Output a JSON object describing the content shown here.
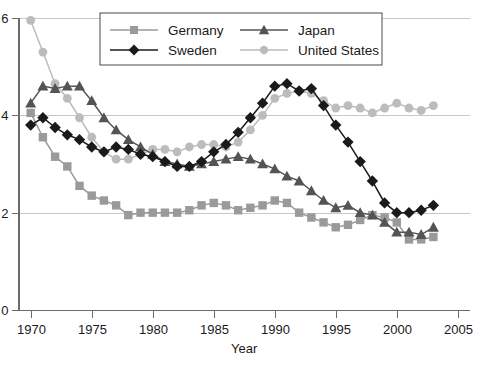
{
  "chart_data": {
    "type": "line",
    "title": "",
    "xlabel": "Year",
    "ylabel": "",
    "xlim": [
      1969,
      2006
    ],
    "ylim": [
      0,
      6
    ],
    "xticks": [
      1970,
      1975,
      1980,
      1985,
      1990,
      1995,
      2000,
      2005
    ],
    "yticks": [
      0,
      2,
      4,
      6
    ],
    "ytick_labels": [
      "0",
      "2",
      "4",
      "6"
    ],
    "xtick_labels": [
      "1970",
      "1975",
      "1980",
      "1985",
      "1990",
      "1995",
      "2000",
      "2005"
    ],
    "grid": "horizontal",
    "legend_position": "top-center",
    "x": [
      1970,
      1971,
      1972,
      1973,
      1974,
      1975,
      1976,
      1977,
      1978,
      1979,
      1980,
      1981,
      1982,
      1983,
      1984,
      1985,
      1986,
      1987,
      1988,
      1989,
      1990,
      1991,
      1992,
      1993,
      1994,
      1995,
      1996,
      1997,
      1998,
      1999,
      2000,
      2001,
      2002,
      2003
    ],
    "series": [
      {
        "name": "Germany",
        "color": "#9a9a9a",
        "marker": "square",
        "values": [
          4.05,
          3.55,
          3.15,
          2.95,
          2.55,
          2.35,
          2.25,
          2.15,
          1.95,
          2.0,
          2.0,
          2.0,
          2.0,
          2.05,
          2.15,
          2.2,
          2.15,
          2.05,
          2.1,
          2.15,
          2.25,
          2.2,
          2.0,
          1.9,
          1.8,
          1.7,
          1.75,
          1.85,
          1.95,
          1.9,
          1.8,
          1.45,
          1.45,
          1.5
        ]
      },
      {
        "name": "Sweden",
        "color": "#1a1a1a",
        "marker": "diamond",
        "values": [
          3.8,
          3.95,
          3.75,
          3.6,
          3.5,
          3.35,
          3.25,
          3.35,
          3.3,
          3.2,
          3.15,
          3.05,
          2.95,
          2.95,
          3.05,
          3.25,
          3.4,
          3.65,
          3.95,
          4.25,
          4.6,
          4.65,
          4.5,
          4.55,
          4.2,
          3.8,
          3.45,
          3.05,
          2.65,
          2.2,
          2.0,
          2.0,
          2.05,
          2.15
        ]
      },
      {
        "name": "Japan",
        "color": "#545454",
        "marker": "triangle",
        "values": [
          4.25,
          4.6,
          4.55,
          4.6,
          4.6,
          4.3,
          3.95,
          3.7,
          3.5,
          3.35,
          3.2,
          3.05,
          3.0,
          2.95,
          3.0,
          3.05,
          3.1,
          3.15,
          3.1,
          3.0,
          2.9,
          2.75,
          2.65,
          2.45,
          2.25,
          2.1,
          2.15,
          2.0,
          1.95,
          1.8,
          1.6,
          1.6,
          1.55,
          1.7
        ]
      },
      {
        "name": "United States",
        "color": "#bcbcbc",
        "marker": "circle",
        "values": [
          5.95,
          5.3,
          4.65,
          4.35,
          3.95,
          3.55,
          3.25,
          3.1,
          3.1,
          3.2,
          3.3,
          3.3,
          3.25,
          3.35,
          3.4,
          3.4,
          3.35,
          3.45,
          3.7,
          4.0,
          4.35,
          4.45,
          4.5,
          4.45,
          4.3,
          4.15,
          4.2,
          4.15,
          4.05,
          4.15,
          4.25,
          4.15,
          4.1,
          4.2
        ]
      }
    ]
  },
  "legend": {
    "entries": [
      {
        "label": "Germany"
      },
      {
        "label": "Japan"
      },
      {
        "label": "Sweden"
      },
      {
        "label": "United States"
      }
    ]
  },
  "axes": {
    "x_title": "Year"
  }
}
